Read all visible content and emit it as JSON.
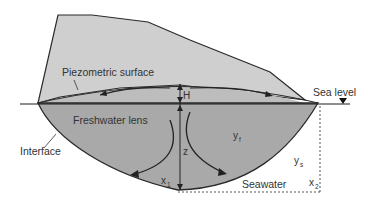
{
  "diagram": {
    "colors": {
      "island": "#cfcfcf",
      "lens": "#a9a9a9",
      "line": "#2a2a2a",
      "background": "#ffffff"
    },
    "labels": {
      "piezometric_surface": "Piezometric surface",
      "sea_level": "Sea level",
      "freshwater_lens": "Freshwater lens",
      "interface": "Interface",
      "seawater": "Seawater",
      "H": "H",
      "z": "z",
      "yf": "y",
      "yf_sub": "f",
      "ys": "y",
      "ys_sub": "s",
      "x1": "x",
      "x1_sub": "1",
      "x2": "x",
      "x2_sub": "2"
    },
    "icons": {
      "sea_level_marker": "down-triangle"
    }
  }
}
